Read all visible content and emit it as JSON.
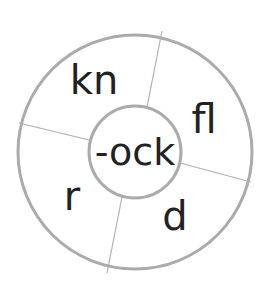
{
  "diagram": {
    "type": "word-wheel",
    "center_label": "-ock",
    "segments": [
      {
        "label": "kn",
        "x": 94,
        "y": 94
      },
      {
        "label": "fl",
        "x": 204,
        "y": 133
      },
      {
        "label": "d",
        "x": 175,
        "y": 230
      },
      {
        "label": "r",
        "x": 72,
        "y": 210
      }
    ],
    "colors": {
      "ring_stroke": "#ababab",
      "divider": "#b0b0b0",
      "text": "#222222",
      "background": "#ffffff"
    }
  }
}
